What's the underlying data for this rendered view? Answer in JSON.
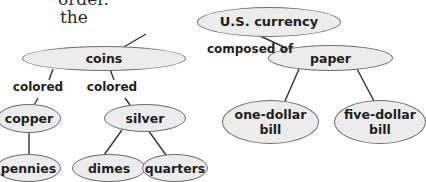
{
  "body_text": {
    "line1_partial": "order.",
    "line2_partial": "the"
  },
  "diagram": {
    "type": "concept-map",
    "nodes": {
      "root": "U.S. currency",
      "coins": "coins",
      "paper": "paper",
      "copper": "copper",
      "silver": "silver",
      "one_dollar_bill": "one-dollar bill",
      "five_dollar_bill": "five-dollar bill",
      "pennies": "pennies",
      "dimes": "dimes",
      "quarters": "quarters"
    },
    "link_labels": {
      "composed_of": "composed of",
      "colored_left": "colored",
      "colored_right": "colored"
    },
    "edges": [
      {
        "from": "U.S. currency",
        "to": "coins",
        "label": "composed of"
      },
      {
        "from": "U.S. currency",
        "to": "paper",
        "label": "composed of"
      },
      {
        "from": "coins",
        "to": "copper",
        "label": "colored"
      },
      {
        "from": "coins",
        "to": "silver",
        "label": "colored"
      },
      {
        "from": "copper",
        "to": "pennies",
        "label": ""
      },
      {
        "from": "silver",
        "to": "dimes",
        "label": ""
      },
      {
        "from": "silver",
        "to": "quarters",
        "label": ""
      },
      {
        "from": "paper",
        "to": "one-dollar bill",
        "label": ""
      },
      {
        "from": "paper",
        "to": "five-dollar bill",
        "label": ""
      }
    ],
    "colors": {
      "node_fill": "#ececec",
      "node_border": "#6e6e6e",
      "line": "#333333",
      "text": "#1e1e1e"
    }
  }
}
